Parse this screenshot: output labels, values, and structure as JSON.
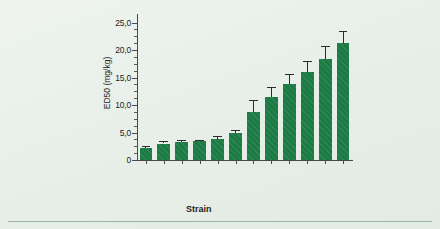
{
  "figure": {
    "background_color": "#e9efe9",
    "bar_color": "#1c7a45",
    "axis_color": "#4a4a4a",
    "rule_color": "#9bb5a3"
  },
  "chart_data": {
    "type": "bar",
    "title": "",
    "subtitle": "",
    "xlabel": "Strain",
    "ylabel": "ED50 (mg/kg)",
    "categories": [
      "BUB",
      "BDA",
      "BH",
      "BALB/cJ",
      "BALB/ByJ",
      "CBA",
      "AKR",
      "A57By",
      "C3H",
      "C576J",
      "Beige J",
      "BK"
    ],
    "values": [
      2.1,
      3.0,
      3.2,
      3.4,
      3.9,
      5.0,
      8.7,
      11.5,
      13.8,
      16.1,
      18.3,
      21.2
    ],
    "errors": [
      0.5,
      0.5,
      0.4,
      0.3,
      0.4,
      0.4,
      2.3,
      1.8,
      1.8,
      2.0,
      2.5,
      2.2
    ],
    "ylim": [
      0,
      26.2
    ],
    "ytick_values": [
      0,
      5,
      10,
      15,
      20,
      25
    ],
    "ytick_labels": [
      "0",
      "5,0",
      "10,0",
      "15,0",
      "20,0",
      "25,0"
    ],
    "minor_tick_interval": 1.25,
    "grid": false,
    "legend": null,
    "error_bar_style": "upper-only-with-cap",
    "bar_fill": "solid green with fine diagonal hatch"
  }
}
